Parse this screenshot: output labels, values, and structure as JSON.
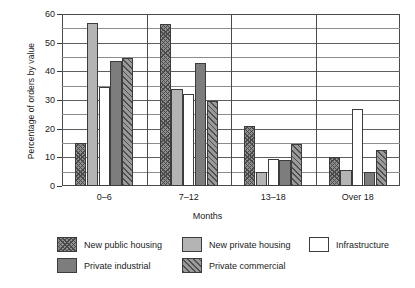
{
  "chart_data": {
    "type": "bar",
    "title": "",
    "xlabel": "Months",
    "ylabel": "Percentage of orders by value",
    "categories": [
      "0–6",
      "7–12",
      "13–18",
      "Over 18"
    ],
    "ylim": [
      0,
      60
    ],
    "yticks": [
      0,
      10,
      20,
      30,
      40,
      50,
      60
    ],
    "ytick_labels": [
      "0",
      "10",
      "20",
      "30",
      "40",
      "50",
      "60"
    ],
    "gridlines_every": 5,
    "grid": true,
    "legend_position": "bottom",
    "series": [
      {
        "name": "New public housing",
        "fill": "cross-hatch-dark",
        "values": [
          15,
          56.5,
          21,
          10
        ]
      },
      {
        "name": "New private housing",
        "fill": "light-grey-solid",
        "values": [
          57,
          34,
          5,
          5.5
        ]
      },
      {
        "name": "Infrastructure",
        "fill": "white",
        "values": [
          34.5,
          32,
          9.5,
          27
        ]
      },
      {
        "name": "Private industrial",
        "fill": "mid-grey-solid",
        "values": [
          43.5,
          43,
          9,
          5
        ]
      },
      {
        "name": "Private commercial",
        "fill": "diagonal-hatch",
        "values": [
          44.5,
          29.5,
          14.5,
          12.5
        ]
      }
    ]
  },
  "legend": {
    "items": [
      {
        "label": "New public housing"
      },
      {
        "label": "New private housing"
      },
      {
        "label": "Infrastructure"
      },
      {
        "label": "Private industrial"
      },
      {
        "label": "Private commercial"
      }
    ]
  },
  "colors": {
    "axis": "#4a4a4a",
    "grid": "#8c8c8c",
    "bar_public_housing": "#8f8f8f",
    "bar_private_housing": "#b4b4b4",
    "bar_infrastructure": "#ffffff",
    "bar_private_industrial": "#7d7d7d",
    "bar_private_commercial": "#9a9a9a"
  }
}
